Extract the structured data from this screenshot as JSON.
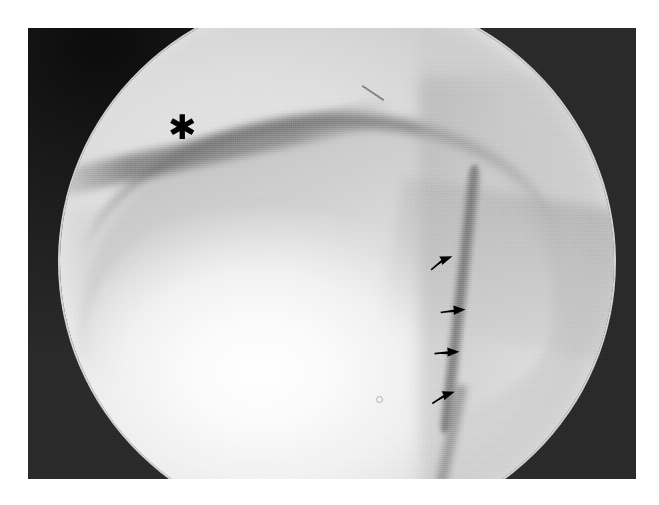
{
  "page": {
    "background_color": "#ffffff",
    "figure_type": "radiograph"
  },
  "figure": {
    "name": "knee-radiograph",
    "modality_label": "fluoroscopic spot radiograph",
    "plate": {
      "left": 28,
      "top": 28,
      "width": 608,
      "height": 451,
      "border_color": "#151515"
    },
    "field_of_view": {
      "shape": "circle",
      "bright_field_color": "#ededed",
      "off_field_color": "#242424"
    },
    "annotations": {
      "asterisk": {
        "icon": "asterisk-marker",
        "glyph": "✱",
        "color": "#000000",
        "x": 140,
        "y": 82,
        "meaning_label": "asterisk"
      },
      "arrows": [
        {
          "icon": "arrow-marker",
          "label": "arrow-1",
          "x": 400,
          "y": 226,
          "rotation": -22,
          "color": "#000000"
        },
        {
          "icon": "arrow-marker",
          "label": "arrow-2",
          "x": 412,
          "y": 275,
          "rotation": -4,
          "color": "#000000"
        },
        {
          "icon": "arrow-marker",
          "label": "arrow-3",
          "x": 406,
          "y": 317,
          "rotation": -2,
          "color": "#000000"
        },
        {
          "icon": "arrow-marker",
          "label": "arrow-4",
          "x": 402,
          "y": 361,
          "rotation": -18,
          "color": "#000000"
        }
      ],
      "arrow_count": 4
    },
    "anatomy_labels": {
      "condyle_dome": "femoral condyle contour",
      "patella_blob": "bright articular highlight",
      "lesion_margin": "marked cortical margin",
      "shaft_line": "diagonal soft-tissue plane",
      "posterior_shade": "posterior shading zone"
    }
  }
}
